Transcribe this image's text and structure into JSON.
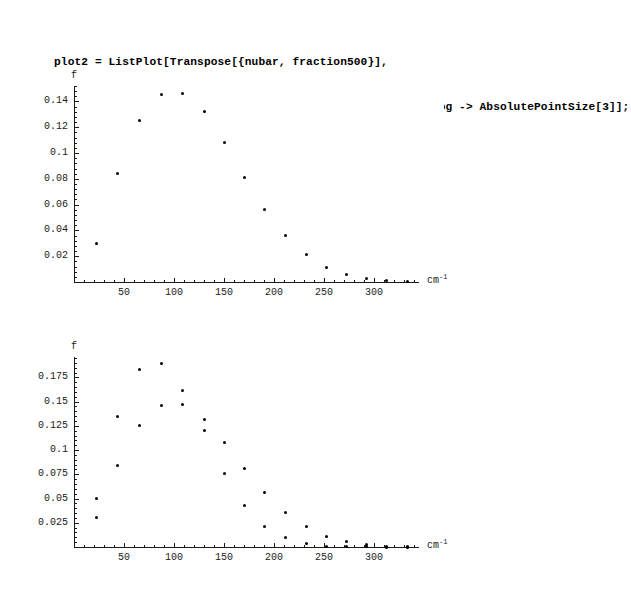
{
  "notebook": {
    "cells": [
      {
        "name": "plot2-input",
        "lines": [
          "plot2 = ListPlot[Transpose[{nubar, fraction500}],",
          "AxesLabel -> {\"cm-1\", \"f\"}, AxesOrigin -> {0, 0}, Prolog -> AbsolutePointSize[3]];"
        ],
        "line1": "plot2 = ListPlot[Transpose[{nubar, fraction500}],",
        "line2_a": "AxesLabel -> {\"cm",
        "line2_sup": "-1",
        "line2_b": "\", \"f\"}, AxesOrigin -> {0, 0}, Prolog -> AbsolutePointSize[3]];"
      },
      {
        "name": "show-input",
        "line1": "Show[plot1, plot2];"
      }
    ]
  },
  "chart_data": [
    {
      "id": "plot2",
      "type": "scatter",
      "title": "",
      "xlabel": "cm-1",
      "xlabel_base": "cm",
      "xlabel_sup": "-1",
      "ylabel": "f",
      "xlim": [
        0,
        345
      ],
      "ylim": [
        0,
        0.152
      ],
      "grid": false,
      "legend": "none",
      "xticks": [
        50,
        100,
        150,
        200,
        250,
        300
      ],
      "xticklabels": [
        "50",
        "100",
        "150",
        "200",
        "250",
        "300"
      ],
      "yticks": [
        0.02,
        0.04,
        0.06,
        0.08,
        0.1,
        0.12,
        0.14
      ],
      "yticklabels": [
        "0.02",
        "0.04",
        "0.06",
        "0.08",
        "0.1",
        "0.12",
        "0.14"
      ],
      "series": [
        {
          "name": "fraction500",
          "x": [
            22,
            43,
            65,
            87,
            108,
            130,
            150,
            170,
            190,
            211,
            232,
            252,
            272,
            292,
            312,
            333
          ],
          "values": [
            0.03,
            0.0845,
            0.125,
            0.1455,
            0.1465,
            0.132,
            0.108,
            0.0812,
            0.0562,
            0.0358,
            0.0212,
            0.0112,
            0.0055,
            0.0025,
            0.001,
            0.0004
          ]
        }
      ]
    },
    {
      "id": "show-plot1-plot2",
      "type": "scatter",
      "title": "",
      "xlabel": "cm-1",
      "xlabel_base": "cm",
      "xlabel_sup": "-1",
      "ylabel": "f",
      "xlim": [
        0,
        345
      ],
      "ylim": [
        0,
        0.196
      ],
      "grid": false,
      "legend": "none",
      "xticks": [
        50,
        100,
        150,
        200,
        250,
        300
      ],
      "xticklabels": [
        "50",
        "100",
        "150",
        "200",
        "250",
        "300"
      ],
      "yticks": [
        0.025,
        0.05,
        0.075,
        0.1,
        0.125,
        0.15,
        0.175
      ],
      "yticklabels": [
        "0.025",
        "0.05",
        "0.075",
        "0.1",
        "0.125",
        "0.15",
        "0.175"
      ],
      "series": [
        {
          "name": "fraction (plot1)",
          "x": [
            22,
            43,
            65,
            87,
            108,
            130,
            150,
            170,
            190,
            211,
            232,
            252,
            272,
            292,
            312,
            333
          ],
          "values": [
            0.05,
            0.135,
            0.183,
            0.189,
            0.161,
            0.132,
            0.108,
            0.0812,
            0.0562,
            0.0358,
            0.0212,
            0.0112,
            0.0055,
            0.0025,
            0.001,
            0.0004
          ]
        },
        {
          "name": "fraction500 (plot2)",
          "x": [
            22,
            43,
            65,
            87,
            108,
            130,
            150,
            170,
            190,
            211,
            232,
            252,
            272,
            292,
            312,
            333
          ],
          "values": [
            0.03,
            0.0845,
            0.125,
            0.1455,
            0.1465,
            0.12,
            0.076,
            0.0425,
            0.021,
            0.0095,
            0.0035,
            0.001,
            0.0003,
            0.0001,
            0.0,
            0.0
          ]
        }
      ]
    }
  ]
}
